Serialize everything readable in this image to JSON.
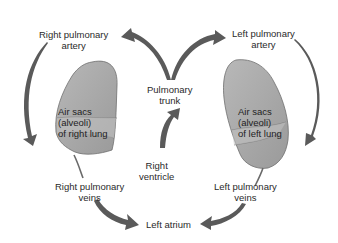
{
  "diagram": {
    "colors": {
      "background": "#ffffff",
      "arrow": "#5a5a5a",
      "lung_fill": "#a9a9a9",
      "lung_lobe": "#bdbdbd",
      "lung_stroke": "#6e6e6e",
      "text": "#2a2a2a"
    },
    "labels": {
      "right_pulmonary_artery": [
        "Right pulmonary",
        "artery"
      ],
      "left_pulmonary_artery": [
        "Left pulmonary",
        "artery"
      ],
      "pulmonary_trunk": [
        "Pulmonary",
        "trunk"
      ],
      "right_ventricle": [
        "Right",
        "ventricle"
      ],
      "right_lung": [
        "Air sacs",
        "(alveoli)",
        "of right lung"
      ],
      "left_lung": [
        "Air sacs",
        "(alveoli)",
        "of left lung"
      ],
      "right_pulmonary_veins": [
        "Right pulmonary",
        "veins"
      ],
      "left_pulmonary_veins": [
        "Left pulmonary",
        "veins"
      ],
      "left_atrium": "Left atrium"
    },
    "flow": [
      {
        "from": "Right ventricle",
        "to": "Pulmonary trunk"
      },
      {
        "from": "Pulmonary trunk",
        "to": "Right pulmonary artery"
      },
      {
        "from": "Pulmonary trunk",
        "to": "Left pulmonary artery"
      },
      {
        "from": "Right pulmonary artery",
        "to": "Air sacs (alveoli) of right lung"
      },
      {
        "from": "Left pulmonary artery",
        "to": "Air sacs (alveoli) of left lung"
      },
      {
        "from": "Air sacs (alveoli) of right lung",
        "to": "Right pulmonary veins"
      },
      {
        "from": "Air sacs (alveoli) of left lung",
        "to": "Left pulmonary veins"
      },
      {
        "from": "Right pulmonary veins",
        "to": "Left atrium"
      },
      {
        "from": "Left pulmonary veins",
        "to": "Left atrium"
      }
    ]
  }
}
